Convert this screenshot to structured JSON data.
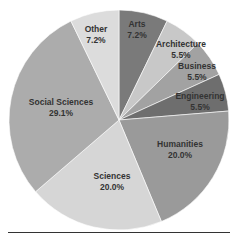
{
  "chart_data": {
    "type": "pie",
    "title": "",
    "start_angle_deg": 0,
    "direction": "clockwise",
    "slices": [
      {
        "label": "Arts",
        "value": 7.2,
        "display": "7.2%",
        "color": "#7a7a7a",
        "lx": 137,
        "ly": 30
      },
      {
        "label": "Architecture",
        "value": 5.5,
        "display": "5.5%",
        "color": "#c8c8c8",
        "lx": 181,
        "ly": 50
      },
      {
        "label": "Business",
        "value": 5.5,
        "display": "5.5%",
        "color": "#a2a2a2",
        "lx": 197,
        "ly": 72
      },
      {
        "label": "Engineering",
        "value": 5.5,
        "display": "5.5%",
        "color": "#6e6e6e",
        "lx": 200,
        "ly": 102
      },
      {
        "label": "Humanities",
        "value": 20.0,
        "display": "20.0%",
        "color": "#9a9a9a",
        "lx": 180,
        "ly": 150
      },
      {
        "label": "Sciences",
        "value": 20.0,
        "display": "20.0%",
        "color": "#d6d6d6",
        "lx": 112,
        "ly": 182
      },
      {
        "label": "Social Sciences",
        "value": 29.1,
        "display": "29.1%",
        "color": "#acacac",
        "lx": 61,
        "ly": 108
      },
      {
        "label": "Other",
        "value": 7.2,
        "display": "7.2%",
        "color": "#dcdcdc",
        "lx": 96,
        "ly": 35
      }
    ],
    "center": [
      119,
      120
    ],
    "radius": 110
  }
}
